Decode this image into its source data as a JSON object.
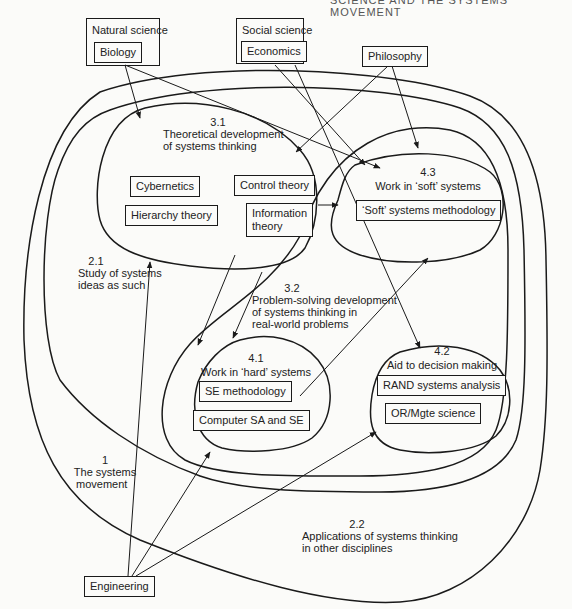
{
  "header": {
    "running_title": "SCIENCE AND THE SYSTEMS MOVEMENT"
  },
  "sources": {
    "natural_science": {
      "label": "Natural science",
      "child": "Biology"
    },
    "social_science": {
      "label": "Social science",
      "child": "Economics"
    },
    "philosophy": {
      "label": "Philosophy"
    },
    "engineering": {
      "label": "Engineering"
    }
  },
  "regions": {
    "r1": {
      "number": "1",
      "line1": "The systems",
      "line2": "movement"
    },
    "r21": {
      "number": "2.1",
      "line1": "Study of systems",
      "line2": "ideas as such"
    },
    "r22": {
      "number": "2.2",
      "line1": "Applications of systems thinking",
      "line2": "in other disciplines"
    },
    "r31": {
      "number": "3.1",
      "line1": "Theoretical development",
      "line2": "of systems thinking"
    },
    "r32": {
      "number": "3.2",
      "line1": "Problem-solving development",
      "line2": "of systems thinking in",
      "line3": "real-world problems"
    },
    "r41": {
      "number": "4.1",
      "title": "Work in ‘hard’ systems"
    },
    "r42": {
      "number": "4.2",
      "title": "Aid to decision making"
    },
    "r43": {
      "number": "4.3",
      "title": "Work in ‘soft’ systems"
    }
  },
  "boxes": {
    "cybernetics": "Cybernetics",
    "hierarchy_theory": "Hierarchy theory",
    "control_theory": "Control theory",
    "information_theory_1": "Information",
    "information_theory_2": "theory",
    "soft_systems_methodology": "‘Soft’ systems methodology",
    "se_methodology": "SE methodology",
    "computer_sa_se": "Computer SA and SE",
    "rand_systems_analysis": "RAND systems analysis",
    "or_mgte_science": "OR/Mgte science"
  },
  "colors": {
    "ink": "#1a1a1a",
    "paper": "#fbfbf9"
  }
}
